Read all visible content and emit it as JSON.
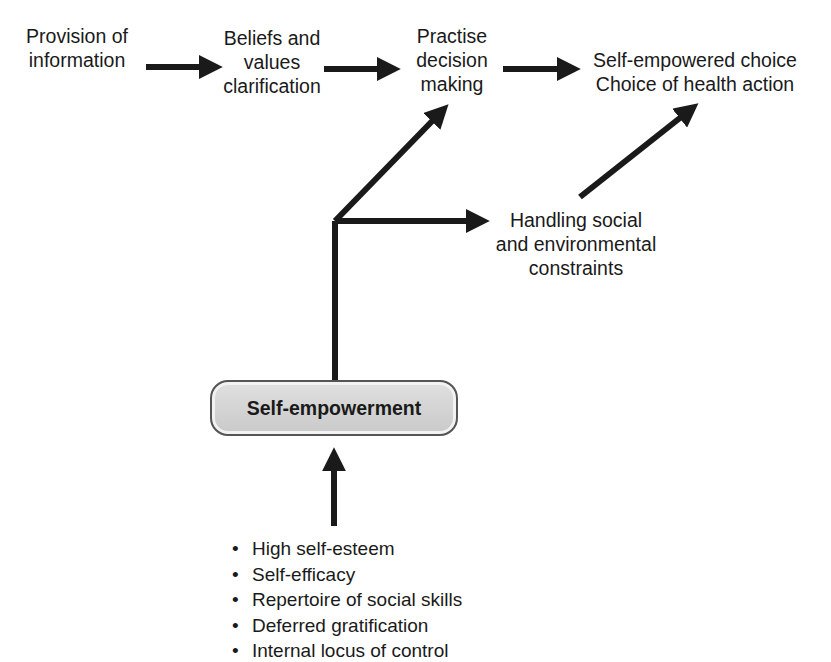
{
  "diagram": {
    "nodes": {
      "provision": {
        "lines": [
          "Provision of",
          "information"
        ]
      },
      "beliefs": {
        "lines": [
          "Beliefs and",
          "values",
          "clarification"
        ]
      },
      "practise": {
        "lines": [
          "Practise",
          "decision",
          "making"
        ]
      },
      "outcome": {
        "lines": [
          "Self-empowered choice",
          "Choice of health action"
        ]
      },
      "handling": {
        "lines": [
          "Handling social",
          "and environmental",
          "constraints"
        ]
      },
      "empowerment": {
        "label": "Self-empowerment"
      }
    },
    "factors": [
      "High self-esteem",
      "Self-efficacy",
      "Repertoire of social skills",
      "Deferred gratification",
      "Internal locus of control"
    ],
    "edges": [
      {
        "from": "provision",
        "to": "beliefs"
      },
      {
        "from": "beliefs",
        "to": "practise"
      },
      {
        "from": "practise",
        "to": "outcome"
      },
      {
        "from": "empowerment",
        "to": "practise"
      },
      {
        "from": "empowerment",
        "to": "handling"
      },
      {
        "from": "handling",
        "to": "outcome"
      },
      {
        "from": "factors",
        "to": "empowerment"
      }
    ],
    "colors": {
      "arrow": "#1a1a1a",
      "pill_fill": "#d4d4d4",
      "pill_border": "#555555"
    }
  }
}
